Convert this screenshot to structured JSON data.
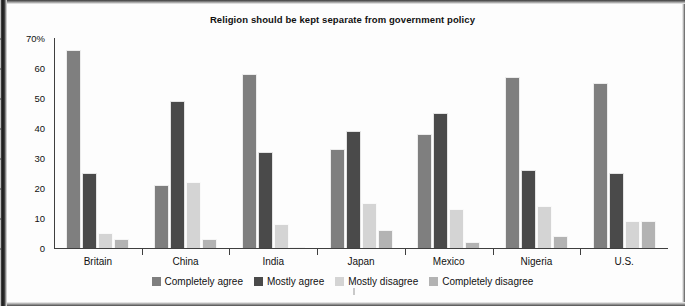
{
  "chart_data": {
    "type": "bar",
    "title": "Religion should be kept separate from government policy",
    "xlabel": "",
    "ylabel": "",
    "ylim": [
      0,
      70
    ],
    "ytick_labels": [
      "70%",
      "60",
      "50",
      "40",
      "30",
      "20",
      "10",
      "0"
    ],
    "ytick_values": [
      70,
      60,
      50,
      40,
      30,
      20,
      10,
      0
    ],
    "grid": false,
    "legend_position": "bottom",
    "categories": [
      "Britain",
      "China",
      "India",
      "Japan",
      "Mexico",
      "Nigeria",
      "U.S."
    ],
    "series": [
      {
        "name": "Completely agree",
        "color": "#7f7f7f",
        "values": [
          66,
          21,
          58,
          33,
          38,
          57,
          55
        ]
      },
      {
        "name": "Mostly agree",
        "color": "#4a4a4a",
        "values": [
          25,
          49,
          32,
          39,
          45,
          26,
          25
        ]
      },
      {
        "name": "Mostly disagree",
        "color": "#d4d4d4",
        "values": [
          5,
          22,
          8,
          15,
          13,
          14,
          9
        ]
      },
      {
        "name": "Completely disagree",
        "color": "#b3b3b3",
        "values": [
          3,
          3,
          0.5,
          6,
          2,
          4,
          9
        ]
      }
    ]
  },
  "colors": {
    "axis": "#3f3f3f",
    "text": "#111111",
    "background": "#fdfdfd"
  }
}
